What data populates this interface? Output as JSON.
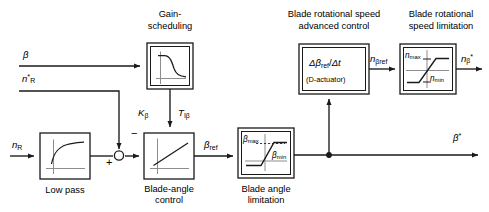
{
  "diagram": {
    "type": "control-block-diagram",
    "canvas": {
      "width": 489,
      "height": 212
    },
    "colors": {
      "line": "#1a1a1a",
      "block_border": "#1a1a1a",
      "block_fill": "#ffffff",
      "axis": "#8a8a8a",
      "curve": "#1a1a1a",
      "text": "#000000"
    },
    "blocks": [
      {
        "id": "gain-scheduling",
        "caption": "Gain-\nscheduling",
        "caption_line1": "Gain-",
        "caption_line2": "scheduling",
        "caption_position": "above",
        "double_border": true,
        "icon": "decaying-curve",
        "x": 147,
        "y": 43,
        "w": 46,
        "h": 46
      },
      {
        "id": "low-pass",
        "caption": "Low pass",
        "caption_position": "below",
        "double_border": false,
        "icon": "saturating-rise-curve",
        "x": 40,
        "y": 133,
        "w": 50,
        "h": 46
      },
      {
        "id": "blade-angle-control",
        "caption_line1": "Blade-angle",
        "caption_line2": "control",
        "caption_position": "below",
        "double_border": false,
        "icon": "ramp-line",
        "x": 144,
        "y": 133,
        "w": 50,
        "h": 46,
        "param_left": "Kβ",
        "param_right": "TΙβ"
      },
      {
        "id": "blade-angle-limitation",
        "caption_line1": "Blade angle",
        "caption_line2": "limitation",
        "caption_position": "below",
        "double_border": true,
        "icon": "saturation-s-curve",
        "x": 238,
        "y": 128,
        "w": 56,
        "h": 50,
        "label_max": "βmax",
        "label_min": "βmin"
      },
      {
        "id": "d-actuator",
        "caption_line1": "Blade rotational speed",
        "caption_line2": "advanced control",
        "caption_position": "above",
        "double_border": true,
        "icon": "text",
        "x": 299,
        "y": 44,
        "w": 70,
        "h": 50,
        "inner_text_main": "Δβref / Δt",
        "inner_text_sub": "(D-actuator)"
      },
      {
        "id": "speed-limitation",
        "caption_line1": "Blade rotational",
        "caption_line2": "speed limitation",
        "caption_position": "above",
        "double_border": true,
        "icon": "saturation-s-curve",
        "x": 400,
        "y": 44,
        "w": 56,
        "h": 50,
        "label_max": "nmax",
        "label_min": "nmin"
      }
    ],
    "summing_junction": {
      "id": "sum-1",
      "x": 119,
      "y": 154,
      "r": 5,
      "signs": [
        {
          "label": "+",
          "position": "below-left"
        },
        {
          "label": "−",
          "position": "above-right"
        }
      ]
    },
    "junction_dots": [
      {
        "id": "beta-star-tap",
        "x": 329,
        "y": 155
      }
    ],
    "signals": [
      {
        "id": "beta-in",
        "label": "β",
        "kind": "input",
        "x": 24,
        "y": 57
      },
      {
        "id": "nr-star-in",
        "label": "n*R",
        "kind": "input",
        "x": 24,
        "y": 82
      },
      {
        "id": "nr-in",
        "label": "nR",
        "kind": "input",
        "x": 14,
        "y": 148
      },
      {
        "id": "beta-ref",
        "label": "βref",
        "kind": "internal",
        "x": 206,
        "y": 146
      },
      {
        "id": "n-beta-ref",
        "label": "nβref",
        "kind": "internal",
        "x": 372,
        "y": 61
      },
      {
        "id": "n-beta-star",
        "label": "n*β",
        "kind": "output",
        "x": 462,
        "y": 61
      },
      {
        "id": "beta-star",
        "label": "β*",
        "kind": "output",
        "x": 455,
        "y": 139
      }
    ],
    "parameters": [
      {
        "id": "k-beta",
        "label": "Kβ",
        "x": 140,
        "y": 113
      },
      {
        "id": "t-i-beta",
        "label": "TΙβ",
        "x": 180,
        "y": 113
      }
    ],
    "connections": [
      "beta input → gain-scheduling",
      "gain-scheduling → blade-angle-control (gain parameters)",
      "n*R input → summing junction (+)",
      "nR input → low pass → summing junction (+)",
      "summing junction → blade-angle-control (−)",
      "blade-angle-control → βref → blade angle limitation",
      "blade angle limitation → β* output",
      "β* tap → D-actuator",
      "D-actuator → nβref → blade rotational speed limitation",
      "blade rotational speed limitation → n*β output"
    ]
  }
}
